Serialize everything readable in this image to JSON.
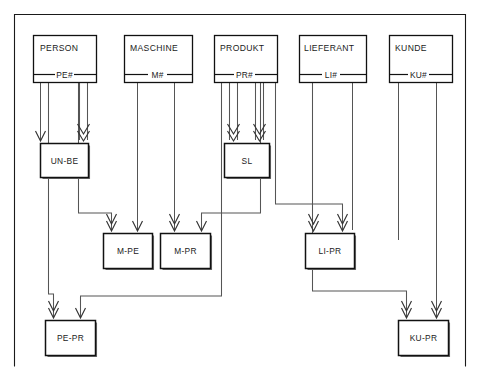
{
  "diagram": {
    "type": "entity-relationship-diagram",
    "title": "",
    "frame": {
      "x": 14,
      "y": 14,
      "width": 452,
      "height": 352
    },
    "entities": [
      {
        "id": "person",
        "label": "PERSON",
        "key": "PE#",
        "box": {
          "x": 33,
          "y": 35,
          "width": 63,
          "height": 47
        }
      },
      {
        "id": "maschine",
        "label": "MASCHINE",
        "key": "M#",
        "box": {
          "x": 124,
          "y": 35,
          "width": 68,
          "height": 47
        }
      },
      {
        "id": "produkt",
        "label": "PRODUKT",
        "key": "PR#",
        "box": {
          "x": 214,
          "y": 35,
          "width": 63,
          "height": 47
        }
      },
      {
        "id": "lieferant",
        "label": "LIEFERANT",
        "key": "LI#",
        "box": {
          "x": 299,
          "y": 35,
          "width": 67,
          "height": 47
        }
      },
      {
        "id": "kunde",
        "label": "KUNDE",
        "key": "KU#",
        "box": {
          "x": 389,
          "y": 35,
          "width": 63,
          "height": 47
        }
      }
    ],
    "relationships": [
      {
        "id": "un-be",
        "label": "UN-BE",
        "box": {
          "x": 40,
          "y": 143,
          "width": 48,
          "height": 34
        },
        "from": [
          "person",
          "person"
        ]
      },
      {
        "id": "sl",
        "label": "SL",
        "box": {
          "x": 224,
          "y": 143,
          "width": 45,
          "height": 34
        },
        "from": [
          "produkt",
          "produkt"
        ]
      },
      {
        "id": "m-pe",
        "label": "M-PE",
        "box": {
          "x": 103,
          "y": 233,
          "width": 49,
          "height": 35
        },
        "from": [
          "person",
          "maschine"
        ]
      },
      {
        "id": "m-pr",
        "label": "M-PR",
        "box": {
          "x": 160,
          "y": 233,
          "width": 50,
          "height": 35
        },
        "from": [
          "maschine",
          "produkt"
        ]
      },
      {
        "id": "li-pr",
        "label": "LI-PR",
        "box": {
          "x": 305,
          "y": 233,
          "width": 49,
          "height": 35
        },
        "from": [
          "produkt",
          "lieferant"
        ]
      },
      {
        "id": "pe-pr",
        "label": "PE-PR",
        "box": {
          "x": 45,
          "y": 320,
          "width": 50,
          "height": 35
        },
        "from": [
          "person",
          "produkt"
        ]
      },
      {
        "id": "ku-pr",
        "label": "KU-PR",
        "box": {
          "x": 398,
          "y": 320,
          "width": 50,
          "height": 35
        },
        "from": [
          "produkt",
          "kunde"
        ]
      }
    ],
    "colors": {
      "background": "#ffffff",
      "stroke": "#111111",
      "connector": "#555555",
      "frame": "#1a1a1a"
    }
  }
}
